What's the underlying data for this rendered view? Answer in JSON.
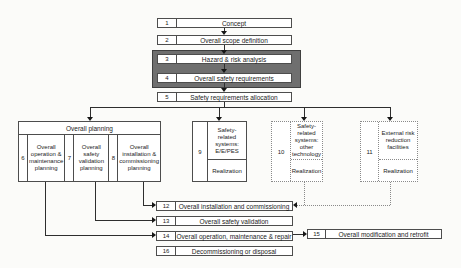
{
  "diagram": {
    "top_boxes": [
      {
        "num": "1",
        "label": "Concept"
      },
      {
        "num": "2",
        "label": "Overall scope definition"
      },
      {
        "num": "3",
        "label": "Hazard & risk analysis"
      },
      {
        "num": "4",
        "label": "Overall safety requirements"
      },
      {
        "num": "5",
        "label": "Safety requirements allocation"
      }
    ],
    "planning": {
      "header": "Overall planning",
      "items": [
        {
          "num": "6",
          "label": "Overall operation & maintenance planning"
        },
        {
          "num": "7",
          "label": "Overall safety validation planning"
        },
        {
          "num": "8",
          "label": "Overall installation & commissioning planning"
        }
      ]
    },
    "realization_boxes": [
      {
        "num": "9",
        "label": "Safety-related systems: E/E/PES",
        "sub": "Realization",
        "border": "solid"
      },
      {
        "num": "10",
        "label": "Safety-related systems: other technology",
        "sub": "Realization",
        "border": "dotted"
      },
      {
        "num": "11",
        "label": "External risk reduction facilities",
        "sub": "Realization",
        "border": "dotted"
      }
    ],
    "bottom_boxes": [
      {
        "num": "12",
        "label": "Overall installation and commissioning"
      },
      {
        "num": "13",
        "label": "Overall safety validation"
      },
      {
        "num": "14",
        "label": "Overall operation, maintenance & repair"
      },
      {
        "num": "16",
        "label": "Decommissioning or disposal"
      }
    ],
    "side_box": {
      "num": "15",
      "label": "Overall modification and retrofit"
    },
    "colors": {
      "highlight_fill": "#6f6f6f",
      "box_border": "#4d4d4d",
      "dotted_border": "#8a8a8a",
      "connector": "#2e2e2e",
      "background": "#fbfbf9"
    }
  }
}
